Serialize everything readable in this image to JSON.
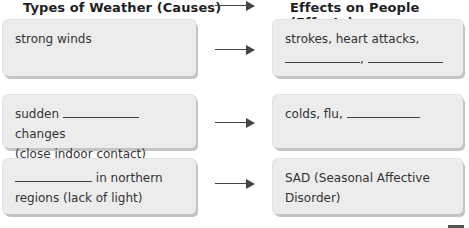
{
  "headers": {
    "causes": "Types of Weather (Causes)",
    "effects": "Effects on People (Effects)"
  },
  "rows": [
    {
      "cause": {
        "line1": "strong winds"
      },
      "effect": {
        "line1": "strokes, heart attacks,",
        "line2_separator": ","
      }
    },
    {
      "cause": {
        "prefix": "sudden",
        "suffix": "changes",
        "line2": "(close indoor contact)"
      },
      "effect": {
        "line1": "colds, flu,"
      }
    },
    {
      "cause": {
        "suffix": "in northern",
        "line2": "regions (lack of light)"
      },
      "effect": {
        "line1": "SAD (Seasonal Affective",
        "line2": "Disorder)"
      }
    }
  ],
  "colors": {
    "box_fill": "#ececec",
    "box_shadow": "#c4c4c4",
    "arrow": "#444444",
    "text": "#333333"
  }
}
